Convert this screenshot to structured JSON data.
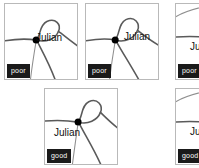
{
  "view": {
    "type": "map-thumbnail-grid",
    "rows": 2,
    "columns": 3,
    "background_color": "#ffffff",
    "panel_border_color": "#b9b9b9",
    "road_color": "#5a5a5a",
    "node_color": "#000000",
    "badge_background": "#1a1a1a",
    "badge_text_color": "#ffffff"
  },
  "panels": [
    {
      "id": "panel-1",
      "place_label": "Julian",
      "badge": "poor",
      "row": 1,
      "column": 1,
      "clipped": false
    },
    {
      "id": "panel-2",
      "place_label": "Julian",
      "badge": "poor",
      "row": 1,
      "column": 2,
      "clipped": false
    },
    {
      "id": "panel-3",
      "place_label": "Julian",
      "badge": "poor",
      "row": 1,
      "column": 3,
      "clipped": true
    },
    {
      "id": "panel-4",
      "place_label": "Julian",
      "badge": "good",
      "row": 2,
      "column": 2,
      "clipped": false
    },
    {
      "id": "panel-5",
      "place_label": "Julian",
      "badge": "good",
      "row": 2,
      "column": 3,
      "clipped": true
    }
  ]
}
